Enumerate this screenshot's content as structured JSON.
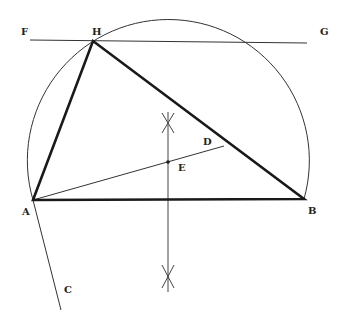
{
  "diagram": {
    "colors": {
      "stroke": "#1a1a1a",
      "thin": "#333333",
      "background": "#ffffff"
    },
    "points": {
      "A": {
        "label": "A",
        "x": 33,
        "y": 200
      },
      "B": {
        "label": "B",
        "x": 304,
        "y": 199
      },
      "H": {
        "label": "H",
        "x": 93,
        "y": 41
      },
      "F": {
        "label": "F",
        "x": 30,
        "y": 40
      },
      "G": {
        "label": "G",
        "x": 307,
        "y": 43
      },
      "C": {
        "label": "C",
        "x": 61,
        "y": 310
      },
      "D": {
        "label": "D",
        "x": 224,
        "y": 146
      },
      "E": {
        "label": "E",
        "x": 168,
        "y": 162
      }
    },
    "labels": {
      "F": "F",
      "G": "G",
      "H": "H",
      "D": "D",
      "E": "E",
      "A": "A",
      "B": "B",
      "C": "C"
    },
    "circle": {
      "cx": 168,
      "cy": 159,
      "r": 141
    },
    "bisector": {
      "x": 168,
      "y1": 112,
      "y2": 292
    }
  }
}
